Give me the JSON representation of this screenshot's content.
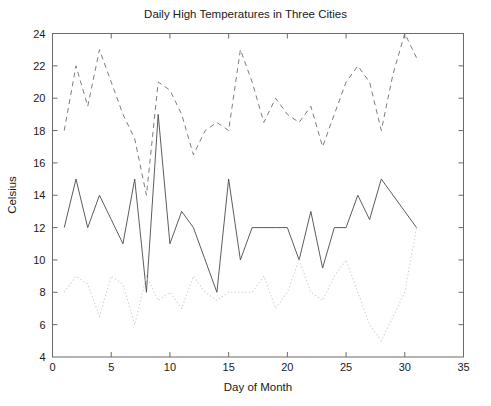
{
  "chart_data": {
    "type": "line",
    "title": "Daily High Temperatures in Three Cities",
    "xlabel": "Day of Month",
    "ylabel": "Celsius",
    "xlim": [
      0,
      35
    ],
    "ylim": [
      4,
      24
    ],
    "xticks": [
      0,
      5,
      10,
      15,
      20,
      25,
      30,
      35
    ],
    "yticks": [
      4,
      6,
      8,
      10,
      12,
      14,
      16,
      18,
      20,
      22,
      24
    ],
    "grid": false,
    "legend": "none",
    "x": [
      1,
      2,
      3,
      4,
      5,
      6,
      7,
      8,
      9,
      10,
      11,
      12,
      13,
      14,
      15,
      16,
      17,
      18,
      19,
      20,
      21,
      22,
      23,
      24,
      25,
      26,
      27,
      28,
      29,
      30,
      31
    ],
    "series": [
      {
        "name": "City A",
        "linestyle": "dashed",
        "color": "#6e6e6e",
        "values": [
          18,
          22,
          19.5,
          23,
          21,
          19,
          17.5,
          14,
          21,
          20.5,
          19,
          16.5,
          18,
          18.5,
          18,
          23,
          21,
          18.5,
          20,
          19,
          18.5,
          19.5,
          17,
          19,
          21,
          22,
          21,
          18,
          21.5,
          24,
          22.5
        ]
      },
      {
        "name": "City B",
        "linestyle": "solid",
        "color": "#4a4a4a",
        "values": [
          12,
          15,
          12,
          14,
          12.5,
          11,
          15,
          8,
          19,
          11,
          13,
          12,
          10,
          8,
          15,
          10,
          12,
          12,
          12,
          12,
          10,
          13,
          9.5,
          12,
          12,
          14,
          12.5,
          15,
          14,
          13,
          12
        ]
      },
      {
        "name": "City C",
        "linestyle": "dotted",
        "color": "#d2d2d2",
        "values": [
          8,
          9,
          8.5,
          6.5,
          9,
          8.5,
          6,
          9,
          7.5,
          8,
          7,
          9,
          8,
          7.5,
          8,
          8,
          8,
          9,
          7,
          8,
          10,
          8,
          7.5,
          9,
          10,
          8,
          6,
          5,
          6.5,
          8,
          12
        ]
      }
    ]
  },
  "axes": {
    "x_tick_labels": [
      "0",
      "5",
      "10",
      "15",
      "20",
      "25",
      "30",
      "35"
    ],
    "y_tick_labels": [
      "4",
      "6",
      "8",
      "10",
      "12",
      "14",
      "16",
      "18",
      "20",
      "22",
      "24"
    ]
  }
}
